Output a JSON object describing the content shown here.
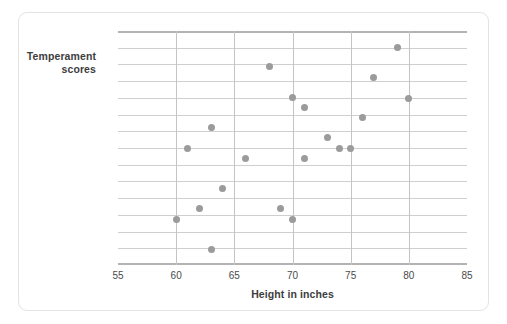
{
  "chart_data": {
    "type": "scatter",
    "title": "",
    "xlabel": "Height in inches",
    "ylabel": "Temperament scores",
    "ylabel_line1": "Temperament",
    "ylabel_line2": "scores",
    "xlim": [
      55,
      85
    ],
    "ylim": [
      25,
      95
    ],
    "xticks": [
      55,
      60,
      65,
      70,
      75,
      80,
      85
    ],
    "yticks": [
      25,
      30,
      35,
      40,
      45,
      50,
      55,
      60,
      65,
      70,
      75,
      80,
      85,
      90,
      95
    ],
    "grid": true,
    "legend": null,
    "point_color": "#9b9b9b",
    "grid_color": "#cfcfcf",
    "axis_color": "#b3b3b3",
    "points": [
      {
        "x": 60,
        "y": 38.5
      },
      {
        "x": 61,
        "y": 60
      },
      {
        "x": 62,
        "y": 42
      },
      {
        "x": 63,
        "y": 66
      },
      {
        "x": 63,
        "y": 29.5
      },
      {
        "x": 64,
        "y": 48
      },
      {
        "x": 66,
        "y": 57
      },
      {
        "x": 68,
        "y": 84.5
      },
      {
        "x": 69,
        "y": 42
      },
      {
        "x": 70,
        "y": 75
      },
      {
        "x": 70,
        "y": 38.5
      },
      {
        "x": 71,
        "y": 72
      },
      {
        "x": 71,
        "y": 57
      },
      {
        "x": 73,
        "y": 63
      },
      {
        "x": 74,
        "y": 60
      },
      {
        "x": 75,
        "y": 60
      },
      {
        "x": 76,
        "y": 69
      },
      {
        "x": 77,
        "y": 81
      },
      {
        "x": 79,
        "y": 90
      },
      {
        "x": 80,
        "y": 74.8
      }
    ]
  }
}
